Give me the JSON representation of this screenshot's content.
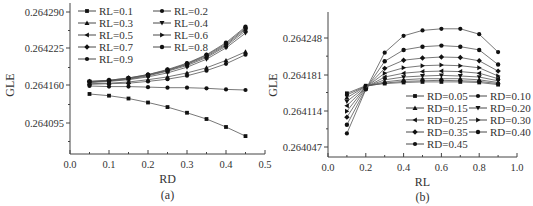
{
  "chart_data": [
    {
      "panel": "(a)",
      "type": "line",
      "title": "",
      "xlabel": "RD",
      "ylabel": "GLE",
      "xlim": [
        0.0,
        0.5
      ],
      "ylim": [
        0.26404,
        0.2643
      ],
      "xticks": [
        "0.0",
        "0.1",
        "0.2",
        "0.3",
        "0.4",
        "0.5"
      ],
      "yticks": [
        "0.264095",
        "0.264160",
        "0.264225",
        "0.264290"
      ],
      "grid": false,
      "legend_position": "upper left",
      "x": [
        0.05,
        0.1,
        0.15,
        0.2,
        0.25,
        0.3,
        0.35,
        0.4,
        0.45
      ],
      "series": [
        {
          "name": "RL=0.1",
          "marker": "square",
          "values": [
            0.264146,
            0.264143,
            0.264138,
            0.264131,
            0.264123,
            0.264113,
            0.264102,
            0.264088,
            0.264072
          ]
        },
        {
          "name": "RL=0.2",
          "marker": "circle",
          "values": [
            0.26416,
            0.264159,
            0.264159,
            0.264158,
            0.264157,
            0.264157,
            0.264156,
            0.264154,
            0.264153
          ]
        },
        {
          "name": "RL=0.3",
          "marker": "triangle-up",
          "values": [
            0.264164,
            0.264165,
            0.264167,
            0.264171,
            0.264176,
            0.264183,
            0.264192,
            0.264205,
            0.26422
          ]
        },
        {
          "name": "RL=0.4",
          "marker": "triangle-down",
          "values": [
            0.264166,
            0.264168,
            0.264171,
            0.264176,
            0.264183,
            0.264193,
            0.264207,
            0.264227,
            0.264253
          ]
        },
        {
          "name": "RL=0.5",
          "marker": "triangle-left",
          "values": [
            0.264167,
            0.264169,
            0.264172,
            0.264178,
            0.264186,
            0.264196,
            0.26421,
            0.26423,
            0.264257
          ]
        },
        {
          "name": "RL=0.6",
          "marker": "triangle-right",
          "values": [
            0.264167,
            0.264169,
            0.264173,
            0.264179,
            0.264187,
            0.264198,
            0.264212,
            0.264232,
            0.26426
          ]
        },
        {
          "name": "RL=0.7",
          "marker": "diamond",
          "values": [
            0.264168,
            0.26417,
            0.264174,
            0.26418,
            0.264188,
            0.264199,
            0.264214,
            0.264234,
            0.264262
          ]
        },
        {
          "name": "RL=0.8",
          "marker": "hexagon",
          "values": [
            0.264168,
            0.26417,
            0.264174,
            0.26418,
            0.264189,
            0.2642,
            0.264215,
            0.264236,
            0.264264
          ]
        },
        {
          "name": "RL=0.9",
          "marker": "circle",
          "values": [
            0.264163,
            0.264164,
            0.264165,
            0.264168,
            0.264172,
            0.264178,
            0.264187,
            0.264199,
            0.264215
          ]
        }
      ]
    },
    {
      "panel": "(b)",
      "type": "line",
      "title": "",
      "xlabel": "RL",
      "ylabel": "GLE",
      "xlim": [
        0.0,
        1.0
      ],
      "ylim": [
        0.264027,
        0.264295
      ],
      "xticks": [
        "0.0",
        "0.2",
        "0.4",
        "0.6",
        "0.8",
        "1.0"
      ],
      "yticks": [
        "0.264047",
        "0.264114",
        "0.264181",
        "0.264248"
      ],
      "grid": false,
      "legend_position": "lower right",
      "x": [
        0.1,
        0.2,
        0.3,
        0.4,
        0.5,
        0.6,
        0.7,
        0.8,
        0.9
      ],
      "series": [
        {
          "name": "RD=0.05",
          "marker": "square",
          "values": [
            0.264146,
            0.26416,
            0.264164,
            0.264166,
            0.264167,
            0.264167,
            0.264167,
            0.264166,
            0.264162
          ]
        },
        {
          "name": "RD=0.10",
          "marker": "circle",
          "values": [
            0.264143,
            0.264159,
            0.264165,
            0.264168,
            0.264169,
            0.26417,
            0.264169,
            0.264168,
            0.264164
          ]
        },
        {
          "name": "RD=0.15",
          "marker": "triangle-up",
          "values": [
            0.264138,
            0.264159,
            0.264167,
            0.264171,
            0.264173,
            0.264173,
            0.264173,
            0.264171,
            0.264166
          ]
        },
        {
          "name": "RD=0.20",
          "marker": "triangle-down",
          "values": [
            0.264131,
            0.264158,
            0.264171,
            0.264176,
            0.264178,
            0.264179,
            0.264178,
            0.264176,
            0.264169
          ]
        },
        {
          "name": "RD=0.25",
          "marker": "triangle-left",
          "values": [
            0.264123,
            0.264157,
            0.264176,
            0.264183,
            0.264186,
            0.264187,
            0.264186,
            0.264183,
            0.264173
          ]
        },
        {
          "name": "RD=0.30",
          "marker": "triangle-right",
          "values": [
            0.264113,
            0.264157,
            0.264183,
            0.264193,
            0.264197,
            0.264198,
            0.264197,
            0.264193,
            0.264178
          ]
        },
        {
          "name": "RD=0.35",
          "marker": "diamond",
          "values": [
            0.264102,
            0.264156,
            0.264192,
            0.264207,
            0.264211,
            0.264213,
            0.264212,
            0.264206,
            0.264187
          ]
        },
        {
          "name": "RD=0.40",
          "marker": "hexagon",
          "values": [
            0.264088,
            0.264154,
            0.264205,
            0.264226,
            0.264232,
            0.264234,
            0.264232,
            0.264226,
            0.264199
          ]
        },
        {
          "name": "RD=0.45",
          "marker": "circle",
          "values": [
            0.264072,
            0.264153,
            0.264221,
            0.264252,
            0.264262,
            0.264265,
            0.264265,
            0.264255,
            0.264222
          ]
        }
      ]
    }
  ]
}
